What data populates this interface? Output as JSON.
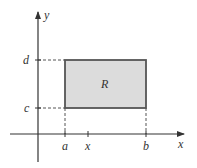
{
  "diagram": {
    "axes": {
      "x_label": "x",
      "y_label": "y"
    },
    "x_ticks": [
      "a",
      "x",
      "b"
    ],
    "y_ticks": [
      "c",
      "d"
    ],
    "region": {
      "label": "R",
      "fill": "#dcdcdc",
      "stroke": "#555555"
    },
    "colors": {
      "axis": "#333333",
      "dashed": "#555555"
    }
  }
}
